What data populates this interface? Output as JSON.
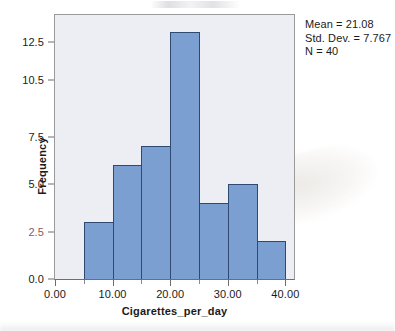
{
  "chart_data": {
    "type": "bar",
    "title": "",
    "xlabel": "Cigarettes_per_day",
    "ylabel": "Frequency",
    "categories": [
      "5-10",
      "10-15",
      "15-20",
      "20-25",
      "25-30",
      "30-35",
      "35-40"
    ],
    "bin_edges": [
      5,
      10,
      15,
      20,
      25,
      30,
      35,
      40
    ],
    "bin_width": 5,
    "values": [
      3,
      6,
      7,
      13,
      4,
      5,
      2
    ],
    "xlim": [
      0,
      41.5
    ],
    "ylim": [
      0,
      13.9
    ],
    "x_tick_values": [
      0,
      10,
      20,
      30,
      40
    ],
    "x_tick_labels": [
      "0.00",
      "10.00",
      "20.00",
      "30.00",
      "40.00"
    ],
    "x_minor_tick_values": [
      5,
      15,
      25,
      35
    ],
    "y_tick_values": [
      0,
      2.5,
      5,
      7.5,
      10.5,
      12.5
    ],
    "y_tick_labels": [
      "0.0",
      "2.5",
      "5.0",
      "7.5",
      "10.5",
      "12.5"
    ],
    "grid": false,
    "legend": null,
    "bar_color": "#7b9fd0",
    "bar_edge_color": "#2f4a72",
    "plot_background_color": "#eceef4",
    "frame_color": "#9a9a9a",
    "annotations": {
      "mean": "Mean = 21.08",
      "std_dev": "Std. Dev. = 7.767",
      "n": "N = 40"
    }
  },
  "axis": {
    "y_title": "Frequency",
    "x_title": "Cigarettes_per_day"
  },
  "stats": {
    "mean": "Mean = 21.08",
    "std_dev": "Std. Dev. = 7.767",
    "n": "N = 40"
  }
}
